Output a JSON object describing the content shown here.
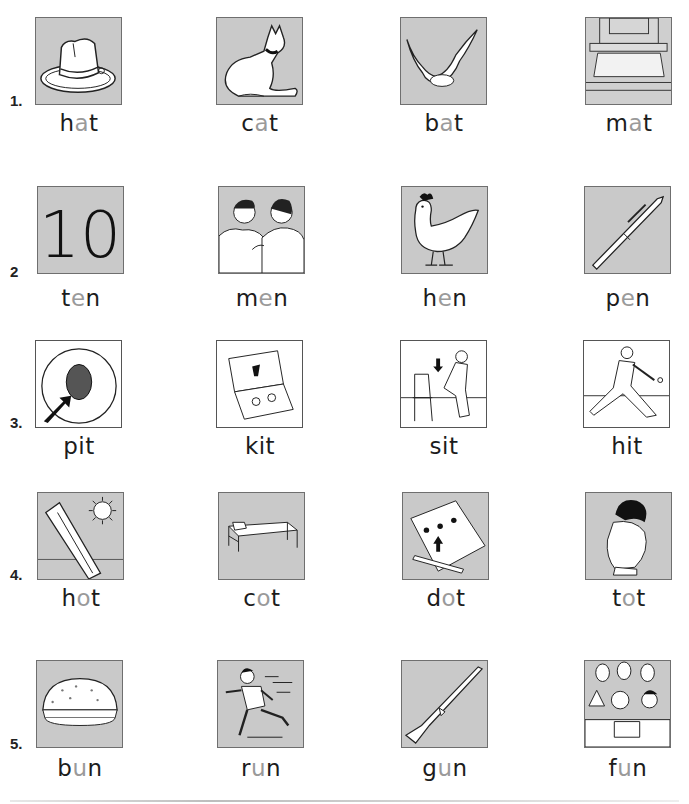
{
  "worksheet": {
    "rows": [
      {
        "label": "1.",
        "items": [
          {
            "word_start": "h",
            "vowel": "a",
            "word_end": "t",
            "word": "hat",
            "picture": "hat-picture"
          },
          {
            "word_start": "c",
            "vowel": "a",
            "word_end": "t",
            "word": "cat",
            "picture": "cat-picture"
          },
          {
            "word_start": "b",
            "vowel": "a",
            "word_end": "t",
            "word": "bat",
            "picture": "bat-picture"
          },
          {
            "word_start": "m",
            "vowel": "a",
            "word_end": "t",
            "word": "mat",
            "picture": "mat-picture"
          }
        ]
      },
      {
        "label": "2",
        "items": [
          {
            "word_start": "t",
            "vowel": "e",
            "word_end": "n",
            "word": "ten",
            "picture": "number-ten-picture",
            "picture_text": "10"
          },
          {
            "word_start": "m",
            "vowel": "e",
            "word_end": "n",
            "word": "men",
            "picture": "men-picture"
          },
          {
            "word_start": "h",
            "vowel": "e",
            "word_end": "n",
            "word": "hen",
            "picture": "hen-picture"
          },
          {
            "word_start": "p",
            "vowel": "e",
            "word_end": "n",
            "word": "pen",
            "picture": "pen-picture"
          }
        ]
      },
      {
        "label": "3.",
        "items": [
          {
            "word_start": "p",
            "vowel": "i",
            "word_end": "t",
            "word": "pit",
            "picture": "pit-picture"
          },
          {
            "word_start": "k",
            "vowel": "i",
            "word_end": "t",
            "word": "kit",
            "picture": "kit-picture"
          },
          {
            "word_start": "s",
            "vowel": "i",
            "word_end": "t",
            "word": "sit",
            "picture": "sit-picture"
          },
          {
            "word_start": "h",
            "vowel": "i",
            "word_end": "t",
            "word": "hit",
            "picture": "hit-picture"
          }
        ]
      },
      {
        "label": "4.",
        "items": [
          {
            "word_start": "h",
            "vowel": "o",
            "word_end": "t",
            "word": "hot",
            "picture": "hot-picture"
          },
          {
            "word_start": "c",
            "vowel": "o",
            "word_end": "t",
            "word": "cot",
            "picture": "cot-picture"
          },
          {
            "word_start": "d",
            "vowel": "o",
            "word_end": "t",
            "word": "dot",
            "picture": "dot-picture"
          },
          {
            "word_start": "t",
            "vowel": "o",
            "word_end": "t",
            "word": "tot",
            "picture": "tot-picture"
          }
        ]
      },
      {
        "label": "5.",
        "items": [
          {
            "word_start": "b",
            "vowel": "u",
            "word_end": "n",
            "word": "bun",
            "picture": "bun-picture"
          },
          {
            "word_start": "r",
            "vowel": "u",
            "word_end": "n",
            "word": "run",
            "picture": "run-picture"
          },
          {
            "word_start": "g",
            "vowel": "u",
            "word_end": "n",
            "word": "gun",
            "picture": "gun-picture"
          },
          {
            "word_start": "f",
            "vowel": "u",
            "word_end": "n",
            "word": "fun",
            "picture": "fun-picture"
          }
        ]
      }
    ],
    "colors": {
      "card_gray": "#c9c9c9",
      "vowel_highlight": "#9a9a9a",
      "text": "#1c1c1c"
    }
  }
}
